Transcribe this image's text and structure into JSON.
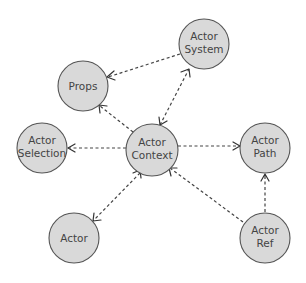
{
  "diagram": {
    "title": "",
    "nodes": [
      {
        "id": "props",
        "label_lines": [
          "Props"
        ],
        "cx": 83,
        "cy": 86,
        "r": 25
      },
      {
        "id": "actor_system",
        "label_lines": [
          "Actor",
          "System"
        ],
        "cx": 204,
        "cy": 44,
        "r": 25
      },
      {
        "id": "actor_selection",
        "label_lines": [
          "Actor",
          "Selection"
        ],
        "cx": 42,
        "cy": 148,
        "r": 25
      },
      {
        "id": "actor_context",
        "label_lines": [
          "Actor",
          "Context"
        ],
        "cx": 152,
        "cy": 150,
        "r": 26
      },
      {
        "id": "actor_path",
        "label_lines": [
          "Actor",
          "Path"
        ],
        "cx": 265,
        "cy": 148,
        "r": 25
      },
      {
        "id": "actor",
        "label_lines": [
          "Actor"
        ],
        "cx": 74,
        "cy": 238,
        "r": 25
      },
      {
        "id": "actor_ref",
        "label_lines": [
          "Actor",
          "Ref"
        ],
        "cx": 265,
        "cy": 238,
        "r": 25
      }
    ],
    "edges": [
      {
        "from": "actor_system",
        "to": "props",
        "style": "dashed",
        "arrow": "end"
      },
      {
        "from": "actor_context",
        "to": "props",
        "style": "dashed",
        "arrow": "end"
      },
      {
        "from": "actor_context",
        "to": "actor_system",
        "style": "dashed",
        "arrow": "both"
      },
      {
        "from": "actor_context",
        "to": "actor_selection",
        "style": "dashed",
        "arrow": "end"
      },
      {
        "from": "actor_context",
        "to": "actor_path",
        "style": "dashed",
        "arrow": "end"
      },
      {
        "from": "actor_context",
        "to": "actor",
        "style": "dashed",
        "arrow": "both"
      },
      {
        "from": "actor_ref",
        "to": "actor_context",
        "style": "dashed",
        "arrow": "end"
      },
      {
        "from": "actor_ref",
        "to": "actor_path",
        "style": "dashed",
        "arrow": "end"
      }
    ],
    "colors": {
      "node_fill": "#d9d9d9",
      "node_stroke": "#555555",
      "edge": "#444444",
      "text": "#444444",
      "background": "#ffffff"
    }
  },
  "labels": {
    "props": "Props",
    "actor_system_1": "Actor",
    "actor_system_2": "System",
    "actor_selection_1": "Actor",
    "actor_selection_2": "Selection",
    "actor_context_1": "Actor",
    "actor_context_2": "Context",
    "actor_path_1": "Actor",
    "actor_path_2": "Path",
    "actor": "Actor",
    "actor_ref_1": "Actor",
    "actor_ref_2": "Ref"
  }
}
